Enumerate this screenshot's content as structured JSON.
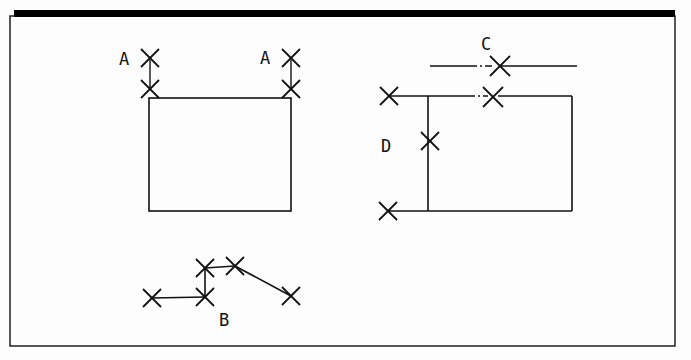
{
  "sheet": {
    "width": 691,
    "height": 360,
    "background_color": "#fdfdfd",
    "ink_color": "#111111",
    "border": {
      "x": 10,
      "y": 16,
      "width": 665,
      "height": 330,
      "stroke_width": 1.4
    },
    "top_bar": {
      "x": 14,
      "y": 10,
      "width": 661,
      "height": 7,
      "color": "#000000"
    }
  },
  "labels": [
    {
      "name": "label-a-left",
      "text": "A",
      "x": 124,
      "y": 65
    },
    {
      "name": "label-a-right",
      "text": "A",
      "x": 265,
      "y": 64
    },
    {
      "name": "label-b",
      "text": "B",
      "x": 224,
      "y": 326
    },
    {
      "name": "label-c",
      "text": "C",
      "x": 486,
      "y": 50
    },
    {
      "name": "label-d",
      "text": "D",
      "x": 386,
      "y": 152
    }
  ],
  "figures": {
    "figure_a": {
      "name": "figure-a-rectangle",
      "rect": {
        "x1": 149,
        "y1": 98,
        "x2": 291,
        "y2": 211
      },
      "leader_lines": [
        {
          "x1": 150,
          "y1": 60,
          "x2": 150,
          "y2": 88
        },
        {
          "x1": 291,
          "y1": 60,
          "x2": 291,
          "y2": 88
        }
      ],
      "markers": [
        {
          "cx": 150,
          "cy": 58,
          "r": 9
        },
        {
          "cx": 150,
          "cy": 89,
          "r": 9
        },
        {
          "cx": 291,
          "cy": 58,
          "r": 9
        },
        {
          "cx": 291,
          "cy": 89,
          "r": 9
        }
      ]
    },
    "figure_b": {
      "name": "figure-b-polyline",
      "segments": [
        {
          "x1": 152,
          "y1": 298,
          "x2": 205,
          "y2": 297
        },
        {
          "x1": 205,
          "y1": 297,
          "x2": 205,
          "y2": 268
        },
        {
          "x1": 205,
          "y1": 268,
          "x2": 235,
          "y2": 266
        },
        {
          "x1": 235,
          "y1": 266,
          "x2": 291,
          "y2": 296
        }
      ],
      "markers": [
        {
          "cx": 152,
          "cy": 298,
          "r": 9
        },
        {
          "cx": 205,
          "cy": 297,
          "r": 9
        },
        {
          "cx": 205,
          "cy": 268,
          "r": 9
        },
        {
          "cx": 235,
          "cy": 266,
          "r": 9
        },
        {
          "cx": 291,
          "cy": 296,
          "r": 9
        }
      ]
    },
    "figure_c": {
      "name": "figure-c-centerline",
      "solid_left": {
        "x1": 430,
        "y1": 66,
        "x2": 470,
        "y2": 66
      },
      "dash_dot": {
        "x1": 470,
        "y1": 66,
        "x2": 494,
        "y2": 66,
        "pattern": "7,3,2,3"
      },
      "solid_right": {
        "x1": 500,
        "y1": 66,
        "x2": 577,
        "y2": 66
      },
      "markers": [
        {
          "cx": 500,
          "cy": 66,
          "r": 10
        }
      ]
    },
    "figure_d": {
      "name": "figure-d-rectangle",
      "rect": {
        "x1": 388,
        "y1": 96,
        "x2": 572,
        "y2": 211
      },
      "top_edge_left": {
        "x1": 388,
        "y1": 96,
        "x2": 470,
        "y2": 96
      },
      "top_edge_dash": {
        "x1": 470,
        "y1": 96,
        "x2": 488,
        "y2": 96,
        "pattern": "5,3,2,3"
      },
      "top_edge_right": {
        "x1": 498,
        "y1": 96,
        "x2": 572,
        "y2": 96
      },
      "divider_line": {
        "x1": 428,
        "y1": 96,
        "x2": 428,
        "y2": 211
      },
      "markers": [
        {
          "cx": 389,
          "cy": 96,
          "r": 9
        },
        {
          "cx": 493,
          "cy": 97,
          "r": 10
        },
        {
          "cx": 430,
          "cy": 141,
          "r": 9
        },
        {
          "cx": 388,
          "cy": 211,
          "r": 9
        }
      ]
    }
  }
}
